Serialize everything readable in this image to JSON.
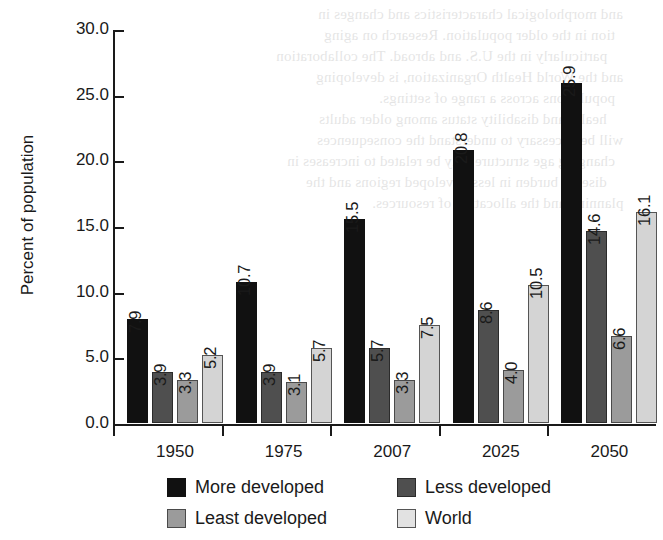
{
  "chart_data": {
    "type": "bar",
    "title": "",
    "xlabel": "",
    "ylabel": "Percent of population",
    "categories": [
      "1950",
      "1975",
      "2007",
      "2025",
      "2050"
    ],
    "series": [
      {
        "name": "More developed",
        "color": "#111111",
        "values": [
          7.9,
          10.7,
          15.5,
          20.8,
          25.9
        ]
      },
      {
        "name": "Less developed",
        "color": "#4f4f4f",
        "values": [
          3.9,
          3.9,
          5.7,
          8.6,
          14.6
        ]
      },
      {
        "name": "Least developed",
        "color": "#9b9b9b",
        "values": [
          3.3,
          3.1,
          3.3,
          4.0,
          6.6
        ]
      },
      {
        "name": "World",
        "color": "#d4d4d4",
        "values": [
          5.2,
          5.7,
          7.5,
          10.5,
          16.1
        ]
      }
    ],
    "value_labels": [
      [
        "7.9",
        "3.9",
        "3.3",
        "5.2"
      ],
      [
        "10.7",
        "3.9",
        "3.1",
        "5.7"
      ],
      [
        "15.5",
        "5.7",
        "3.3",
        "7.5"
      ],
      [
        "20.8",
        "8.6",
        "4.0",
        "10.5"
      ],
      [
        "25.9",
        "14.6",
        "6.6",
        "16.1"
      ]
    ],
    "ylim": [
      0,
      30
    ],
    "ytick_values": [
      0,
      5,
      10,
      15,
      20,
      25,
      30
    ],
    "ytick_labels": [
      "0.0",
      "5.0",
      "10.0",
      "15.0",
      "20.0",
      "25.0",
      "30.0"
    ],
    "grid": false,
    "legend_position": "bottom",
    "legend_columns": 2,
    "value_label_rotation": -90
  },
  "artifact": {
    "description": "scanned page bleed-through",
    "lines": [
      "and morphological characteristics and changes in",
      "tion in the older population. Research on aging",
      "particularly in the U.S. and abroad. The collaboration",
      "and the World Health Organization, is developing",
      "populations across a range of settings.",
      "health and disability status among older adults",
      "will be necessary to understand the consequences",
      "changing age structure may be related to increases in",
      "disease burden in less developed regions and the",
      "planning and the allocation of resources."
    ]
  }
}
